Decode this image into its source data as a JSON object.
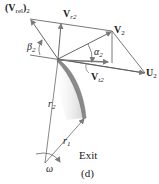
{
  "diagram": {
    "caption": "(d)",
    "location_label": "Exit",
    "colors": {
      "vector_line": "#555555",
      "arrow_head": "#888888",
      "blade_fill": "#8a8a8a",
      "blade_shadow": "#d8d8d8",
      "text": "#222222"
    },
    "labels": {
      "v_rel2": {
        "main": "(V",
        "sub1": "rel",
        "close": ")",
        "sub2": "2"
      },
      "v_r2": {
        "main": "V",
        "sub": "r2"
      },
      "v_2": {
        "main": "V",
        "sub": "2"
      },
      "u_2": {
        "main": "U",
        "sub": "2"
      },
      "v_t2": {
        "main": "V",
        "sub": "t2"
      },
      "beta_2": {
        "main": "β",
        "sub": "2"
      },
      "alpha_2": {
        "main": "α",
        "sub": "2"
      },
      "r_2": {
        "main": "r",
        "sub": "2"
      },
      "r_1": {
        "main": "r",
        "sub": "1"
      },
      "omega": {
        "main": "ω"
      }
    },
    "vectors": [
      {
        "name": "relative-velocity",
        "from": [
          58,
          59
        ],
        "to": [
          30,
          19
        ]
      },
      {
        "name": "radial-velocity",
        "from": [
          58,
          59
        ],
        "to": [
          62,
          23
        ]
      },
      {
        "name": "absolute-velocity",
        "from": [
          58,
          59
        ],
        "to": [
          112,
          31
        ]
      },
      {
        "name": "blade-velocity",
        "from": [
          58,
          59
        ],
        "to": [
          145,
          73
        ]
      },
      {
        "name": "tangential-velocity",
        "from": [
          58,
          59
        ],
        "to": [
          112,
          63
        ]
      }
    ]
  }
}
